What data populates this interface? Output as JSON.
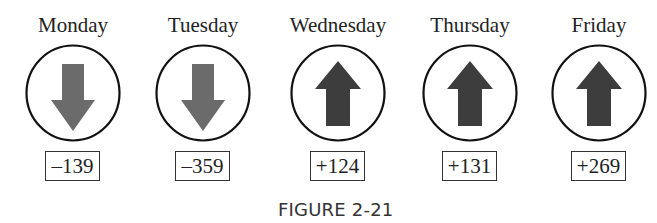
{
  "figure": {
    "caption": "FIGURE 2-21",
    "colors": {
      "circle_stroke": "#111111",
      "down_arrow": "#6b6b6b",
      "up_arrow": "#3d3d3d",
      "box_border": "#333333",
      "text": "#222222"
    },
    "days": [
      {
        "label": "Monday",
        "direction": "down",
        "arrow_icon": "down-arrow-icon",
        "value": "–139"
      },
      {
        "label": "Tuesday",
        "direction": "down",
        "arrow_icon": "down-arrow-icon",
        "value": "–359"
      },
      {
        "label": "Wednesday",
        "direction": "up",
        "arrow_icon": "up-arrow-icon",
        "value": "+124"
      },
      {
        "label": "Thursday",
        "direction": "up",
        "arrow_icon": "up-arrow-icon",
        "value": "+131"
      },
      {
        "label": "Friday",
        "direction": "up",
        "arrow_icon": "up-arrow-icon",
        "value": "+269"
      }
    ]
  }
}
